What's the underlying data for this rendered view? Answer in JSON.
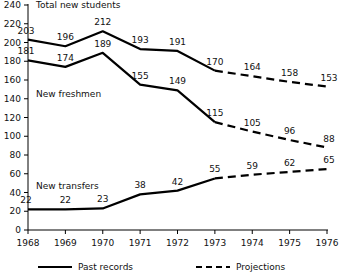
{
  "chart_data": {
    "type": "line",
    "title": "",
    "xlabel": "",
    "ylabel": "",
    "x": [
      1968,
      1969,
      1970,
      1971,
      1972,
      1973,
      1974,
      1975,
      1976
    ],
    "xtick_labels": [
      "1968",
      "1969",
      "1970",
      "1971",
      "1972",
      "1973",
      "1974",
      "1975",
      "1976"
    ],
    "ytick_labels": [
      "0",
      "20",
      "40",
      "60",
      "80",
      "100",
      "120",
      "140",
      "160",
      "180",
      "200",
      "220",
      "240"
    ],
    "yticks": [
      0,
      20,
      40,
      60,
      80,
      100,
      120,
      140,
      160,
      180,
      200,
      220,
      240
    ],
    "ylim": [
      0,
      240
    ],
    "xlim": [
      1968,
      1976
    ],
    "grid": false,
    "legend_position": "bottom",
    "series": [
      {
        "name": "Total new students",
        "values": [
          203,
          196,
          212,
          193,
          191,
          170,
          164,
          158,
          153
        ],
        "solid_through": 1973,
        "label_offsets": [
          -2,
          0,
          0,
          0,
          0,
          0,
          0,
          0,
          2
        ]
      },
      {
        "name": "New freshmen",
        "values": [
          181,
          174,
          189,
          155,
          149,
          115,
          105,
          96,
          88
        ],
        "solid_through": 1973,
        "label_offsets": [
          -2,
          0,
          0,
          0,
          0,
          0,
          0,
          0,
          2
        ]
      },
      {
        "name": "New transfers",
        "values": [
          22,
          22,
          23,
          38,
          42,
          55,
          59,
          62,
          65
        ],
        "solid_through": 1973,
        "label_offsets": [
          -2,
          0,
          0,
          0,
          0,
          0,
          0,
          0,
          2
        ]
      }
    ],
    "annotations": [
      {
        "text": "Total new students",
        "x": 1968,
        "y": 240,
        "name": "series-annotation-total"
      },
      {
        "text": "New freshmen",
        "x": 1968,
        "y": 145,
        "name": "series-annotation-freshmen"
      },
      {
        "text": "New transfers",
        "x": 1968,
        "y": 47,
        "name": "series-annotation-transfers"
      }
    ],
    "legend": [
      {
        "label": "Past records",
        "style": "solid"
      },
      {
        "label": "Projections",
        "style": "dashed"
      }
    ],
    "colors": {
      "line": "#000000",
      "axis": "#000000",
      "text": "#111111",
      "background": "#ffffff"
    }
  }
}
